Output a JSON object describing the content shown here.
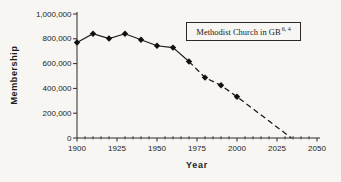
{
  "chart_data": {
    "type": "line",
    "title": "",
    "xlabel": "Year",
    "ylabel": "Membership",
    "legend": {
      "label": "Methodist Church in GB",
      "superscript": "6, 4"
    },
    "xlim": [
      1900,
      2050
    ],
    "ylim": [
      0,
      1000000
    ],
    "x_major_ticks": [
      1900,
      1925,
      1950,
      1975,
      2000,
      2025,
      2050
    ],
    "x_minor_step": 5,
    "y_ticks": [
      0,
      200000,
      400000,
      600000,
      800000,
      1000000
    ],
    "x": [
      1900,
      1910,
      1920,
      1930,
      1940,
      1950,
      1960,
      1970,
      1980,
      1990,
      2000
    ],
    "values": [
      770000,
      841000,
      802000,
      841000,
      792000,
      744000,
      729000,
      617000,
      487000,
      425000,
      333000
    ],
    "solid_until_x": 1970,
    "projection_end": {
      "x": 2034,
      "y": 0
    },
    "marker": "diamond",
    "grid": "off",
    "legend_position": "top-right-inside",
    "colors": {
      "line": "#1a1a1a",
      "marker": "#111111",
      "axis": "#2a2a2a",
      "text": "#1a1a1a",
      "background": "#f7f6f3"
    }
  }
}
